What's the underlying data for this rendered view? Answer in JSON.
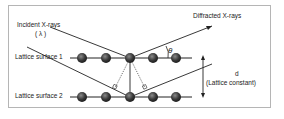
{
  "diagram": {
    "labels": {
      "incident": "Incident X-rays",
      "wavelength": "( λ )",
      "diffracted": "Diffracted X-rays",
      "theta": "θ",
      "surface1": "Lattice surface 1",
      "surface2": "Lattice surface 2",
      "d": "d",
      "lattice_constant": "(Lattice constant)"
    },
    "rows": [
      {
        "name": "Lattice surface 1",
        "atoms": 5
      },
      {
        "name": "Lattice surface 2",
        "atoms": 5
      }
    ],
    "colors": {
      "atom": "#3a3a3a",
      "line": "#222222",
      "frame": "#b5b5b5"
    }
  }
}
